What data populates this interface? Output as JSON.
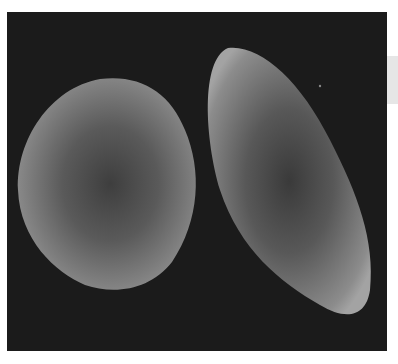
{
  "image": {
    "description": "Grayscale micrograph of two cells on a dark background",
    "background_color": "#1b1b1b",
    "cell_color": "#8a8a8a",
    "cells": [
      {
        "name": "round-cell",
        "shape": "oval"
      },
      {
        "name": "elongated-cell",
        "shape": "sickle-oval"
      }
    ]
  }
}
